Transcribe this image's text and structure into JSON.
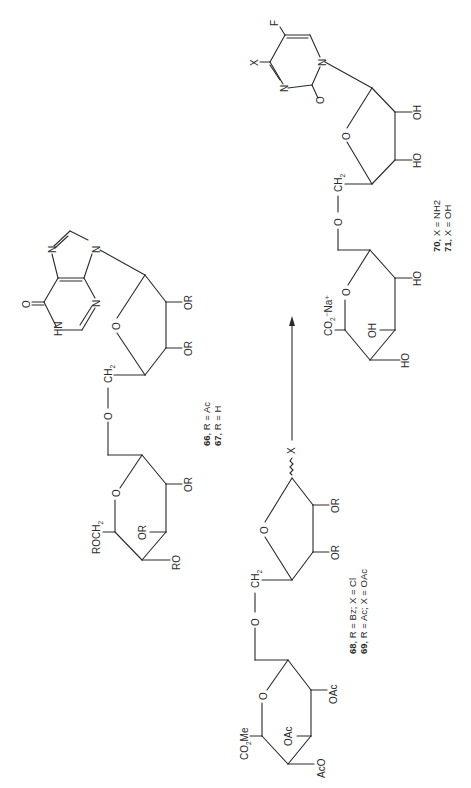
{
  "scheme": {
    "orientation": "rotated 90deg counter-clockwise",
    "compounds": [
      {
        "id": "66-67",
        "base": {
          "atoms": [
            "N",
            "N",
            "N",
            "HN",
            "O"
          ],
          "name": "hypoxanthine"
        },
        "sugar_substituents": [
          "OR",
          "OR",
          "CH2"
        ],
        "linker": "O",
        "pyranose_substituents": [
          "ROCH2",
          "OR",
          "OR",
          "RO",
          "O"
        ],
        "label_line1_num": "66",
        "label_line1_rest": ", R = Ac",
        "label_line2_num": "67",
        "label_line2_rest": ", R = H"
      },
      {
        "id": "68-69",
        "anomeric": "X",
        "sugar_substituents": [
          "OR",
          "OR",
          "CH2"
        ],
        "linker": "O",
        "pyranose_substituents": [
          "CO2Me",
          "OAc",
          "OAc",
          "AcO",
          "O"
        ],
        "label_line1_num": "68",
        "label_line1_rest": ", R = Bz; X = Cl",
        "label_line2_num": "69",
        "label_line2_rest": ", R = Ac; X = OAc"
      },
      {
        "id": "70-71",
        "base": {
          "atoms": [
            "N",
            "N",
            "O",
            "X",
            "F"
          ],
          "name": "5-fluoropyrimidinone"
        },
        "sugar_substituents": [
          "OH",
          "HO",
          "CH2"
        ],
        "linker": "O",
        "pyranose_substituents": [
          "CO2-Na+",
          "OH",
          "HO",
          "HO",
          "O"
        ],
        "label_line1_num": "70",
        "label_line1_rest": ", X = NH2",
        "label_line2_num": "71",
        "label_line2_rest": ", X = OH"
      }
    ],
    "arrow": {
      "direction": "up",
      "from": "68-69",
      "to": "70-71"
    }
  },
  "text": {
    "N": "N",
    "HN": "HN",
    "O": "O",
    "OR": "OR",
    "RO": "RO",
    "OH": "OH",
    "HO": "HO",
    "CH": "CH",
    "two": "2",
    "ROCH": "ROCH",
    "X": "X",
    "F": "F",
    "OAc": "OAc",
    "AcO": "AcO",
    "CO": "CO",
    "Me": "Me",
    "Na": "⁻Na⁺"
  }
}
